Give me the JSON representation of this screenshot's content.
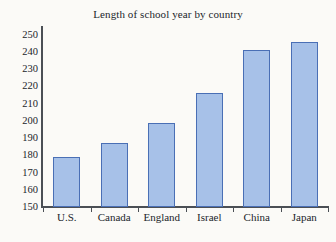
{
  "chart_data": {
    "type": "bar",
    "title": "Length of school year by country",
    "xlabel": "",
    "ylabel": "",
    "categories": [
      "U.S.",
      "Canada",
      "England",
      "Israel",
      "China",
      "Japan"
    ],
    "values": [
      179,
      187,
      199,
      216,
      241,
      246
    ],
    "ylim": [
      150,
      255
    ],
    "ytick_start": 150,
    "ytick_end": 250,
    "ytick_step": 10,
    "yticks": [
      250,
      240,
      230,
      220,
      210,
      200,
      190,
      180,
      170,
      160,
      150
    ],
    "ytick_labels": [
      "250",
      "240",
      "230",
      "220",
      "210",
      "200",
      "190",
      "180",
      "170",
      "160",
      "150"
    ],
    "grid": false,
    "legend": null,
    "bar_fill_color": "#a7c1e8",
    "bar_border_color": "#4a6fb5",
    "axis_color": "#4b4f55",
    "background_color": "#fbfaf7",
    "text_color": "#22252b"
  }
}
